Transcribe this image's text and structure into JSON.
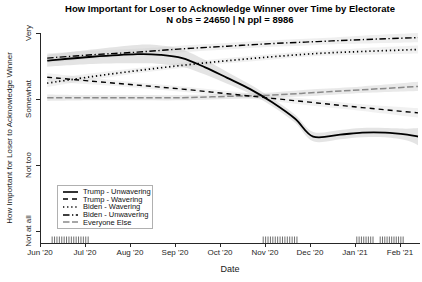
{
  "title": "How Important for Loser to Acknowledge Winner over Time by Electorate",
  "subtitle": "N obs = 24650 | N ppl = 8986",
  "chart_data": {
    "type": "line",
    "title": "How Important for Loser to Acknowledge Winner over Time by Electorate",
    "subtitle": "N obs = 24650 | N ppl = 8986",
    "xlabel": "Date",
    "ylabel": "How Important for Loser to Acknowledge Winner",
    "x_unit": "months since Jun 1 2020",
    "x_tick_labels": [
      "Jun '20",
      "Jul '20",
      "Aug '20",
      "Sep '20",
      "Oct '20",
      "Nov '20",
      "Dec '20",
      "Jan '21",
      "Feb '21"
    ],
    "x_tick_months": [
      0,
      1,
      2,
      3,
      4,
      5,
      6,
      7,
      8
    ],
    "xlim_months": [
      0,
      8.44
    ],
    "y_tick_labels": [
      "Not at all",
      "Not too",
      "Somewhat",
      "Very"
    ],
    "y_tick_values": [
      1,
      2,
      3,
      4
    ],
    "ylim": [
      1,
      4
    ],
    "grid": false,
    "legend_position": "bottom-left-inside",
    "band_color": "#c9c9c9",
    "series": [
      {
        "name": "Trump - Unwavering",
        "dash": "solid",
        "color": "#000000",
        "width": 1.8,
        "band_opacity": 0.5,
        "points": [
          [
            0.16,
            3.58
          ],
          [
            1.16,
            3.64
          ],
          [
            2.16,
            3.68
          ],
          [
            2.67,
            3.67
          ],
          [
            3.16,
            3.62
          ],
          [
            3.67,
            3.48
          ],
          [
            4.16,
            3.32
          ],
          [
            4.67,
            3.15
          ],
          [
            5.16,
            2.95
          ],
          [
            5.67,
            2.7
          ],
          [
            6.07,
            2.43
          ],
          [
            6.67,
            2.46
          ],
          [
            7.16,
            2.49
          ],
          [
            7.67,
            2.49
          ],
          [
            8.16,
            2.46
          ],
          [
            8.4,
            2.43
          ]
        ],
        "band": [
          0.09,
          0.11,
          0.14,
          0.14,
          0.13,
          0.11,
          0.09,
          0.07,
          0.06,
          0.06,
          0.07,
          0.07,
          0.07,
          0.07,
          0.09,
          0.13
        ]
      },
      {
        "name": "Trump - Wavering",
        "dash": "dashed",
        "color": "#000000",
        "width": 1.4,
        "band_opacity": 0.25,
        "points": [
          [
            0.16,
            3.33
          ],
          [
            1.16,
            3.27
          ],
          [
            2.16,
            3.21
          ],
          [
            3.16,
            3.15
          ],
          [
            4.16,
            3.08
          ],
          [
            5.16,
            3.01
          ],
          [
            6.16,
            2.94
          ],
          [
            7.16,
            2.87
          ],
          [
            8.4,
            2.79
          ]
        ],
        "band": [
          0.06,
          0.05,
          0.04,
          0.04,
          0.04,
          0.04,
          0.05,
          0.05,
          0.07
        ]
      },
      {
        "name": "Biden - Wavering",
        "dash": "dotted",
        "color": "#000000",
        "width": 1.7,
        "band_opacity": 0.25,
        "points": [
          [
            0.16,
            3.24
          ],
          [
            1.16,
            3.34
          ],
          [
            2.16,
            3.43
          ],
          [
            3.16,
            3.51
          ],
          [
            4.16,
            3.58
          ],
          [
            5.16,
            3.64
          ],
          [
            6.16,
            3.69
          ],
          [
            7.16,
            3.72
          ],
          [
            8.4,
            3.75
          ]
        ],
        "band": [
          0.06,
          0.05,
          0.04,
          0.04,
          0.04,
          0.04,
          0.04,
          0.05,
          0.06
        ]
      },
      {
        "name": "Biden - Unwavering",
        "dash": "dashdot",
        "color": "#000000",
        "width": 1.4,
        "band_opacity": 0.3,
        "points": [
          [
            0.16,
            3.62
          ],
          [
            1.16,
            3.67
          ],
          [
            2.16,
            3.71
          ],
          [
            3.16,
            3.76
          ],
          [
            4.16,
            3.8
          ],
          [
            5.16,
            3.84
          ],
          [
            6.16,
            3.87
          ],
          [
            7.16,
            3.9
          ],
          [
            8.4,
            3.93
          ]
        ],
        "band": [
          0.07,
          0.06,
          0.05,
          0.05,
          0.05,
          0.05,
          0.05,
          0.06,
          0.07
        ]
      },
      {
        "name": "Everyone Else",
        "dash": "longdash",
        "color": "#8a8a8a",
        "width": 1.5,
        "band_opacity": 0.4,
        "points": [
          [
            0.16,
            3.02
          ],
          [
            1.16,
            3.02
          ],
          [
            2.16,
            3.02
          ],
          [
            3.16,
            3.02
          ],
          [
            4.16,
            3.04
          ],
          [
            5.16,
            3.06
          ],
          [
            6.16,
            3.1
          ],
          [
            7.16,
            3.14
          ],
          [
            8.4,
            3.19
          ]
        ],
        "band": [
          0.05,
          0.04,
          0.04,
          0.04,
          0.04,
          0.04,
          0.05,
          0.05,
          0.07
        ]
      }
    ],
    "rug": {
      "color": "#6e6e6e",
      "clusters": [
        {
          "start_month": 0.27,
          "end_month": 1.07,
          "ticks": 16
        },
        {
          "start_month": 4.96,
          "end_month": 5.71,
          "ticks": 15
        },
        {
          "start_month": 7.04,
          "end_month": 7.4,
          "ticks": 8
        },
        {
          "start_month": 7.56,
          "end_month": 8.07,
          "ticks": 11
        }
      ]
    },
    "axis_color": "#262626"
  },
  "legend": {
    "items": [
      {
        "label": "Trump - Unwavering",
        "dash": "solid",
        "color": "#000000"
      },
      {
        "label": "Trump - Wavering",
        "dash": "dashed",
        "color": "#000000"
      },
      {
        "label": "Biden - Wavering",
        "dash": "dotted",
        "color": "#000000"
      },
      {
        "label": "Biden - Unwavering",
        "dash": "dashdot",
        "color": "#000000"
      },
      {
        "label": "Everyone Else",
        "dash": "longdash",
        "color": "#8a8a8a"
      }
    ]
  }
}
